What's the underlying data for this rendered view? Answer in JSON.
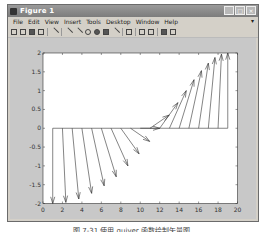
{
  "window": {
    "title": "Figure 1",
    "controls": [
      "minimize",
      "maximize",
      "close"
    ]
  },
  "menubar": {
    "items": [
      "File",
      "Edit",
      "View",
      "Insert",
      "Tools",
      "Desktop",
      "Window",
      "Help"
    ]
  },
  "toolbar": {
    "buttons": [
      "new-figure",
      "open-file",
      "save",
      "print",
      "edit-plot",
      "zoom-in",
      "zoom-out",
      "pan",
      "rotate-3d",
      "data-cursor",
      "brush",
      "link",
      "colorbar",
      "legend",
      "hide-plot-tools",
      "show-plot-tools"
    ]
  },
  "caption": "图 7-31  使用 quiver 函数绘制矢量图",
  "chart_data": {
    "type": "quiver",
    "title": "",
    "xlabel": "",
    "ylabel": "",
    "xlim": [
      0,
      20
    ],
    "ylim": [
      -2,
      2
    ],
    "xticks": [
      0,
      2,
      4,
      6,
      8,
      10,
      12,
      14,
      16,
      18,
      20
    ],
    "yticks": [
      -2,
      -1.5,
      -1,
      -0.5,
      0,
      0.5,
      1,
      1.5,
      2
    ],
    "xtick_labels": [
      "0",
      "2",
      "4",
      "6",
      "8",
      "10",
      "12",
      "14",
      "16",
      "18",
      "20"
    ],
    "ytick_labels": [
      "-2",
      "-1.5",
      "-1",
      "-0.5",
      "0",
      "0.5",
      "1",
      "1.5",
      "2"
    ],
    "grid": false,
    "x": [
      1,
      2,
      3,
      4,
      5,
      6,
      7,
      8,
      9,
      10,
      11,
      12,
      13,
      14,
      15,
      16,
      17,
      18,
      19
    ],
    "y": [
      0,
      0,
      0,
      0,
      0,
      0,
      0,
      0,
      0,
      0,
      0,
      0,
      0,
      0,
      0,
      0,
      0,
      0,
      0
    ],
    "u": [
      0.0,
      0.35,
      0.68,
      1.0,
      1.29,
      1.53,
      1.73,
      1.88,
      1.97,
      2.0,
      1.97,
      1.88,
      1.73,
      1.53,
      1.29,
      1.0,
      0.68,
      0.35,
      0.0
    ],
    "v": [
      -2.0,
      -1.97,
      -1.88,
      -1.73,
      -1.53,
      -1.29,
      -1.0,
      -0.68,
      -0.35,
      0.0,
      0.35,
      0.68,
      1.0,
      1.29,
      1.53,
      1.73,
      1.88,
      1.97,
      2.0
    ],
    "baseline": {
      "x_start": 1,
      "x_end": 19,
      "y": 0
    },
    "line_color": "#333333"
  }
}
